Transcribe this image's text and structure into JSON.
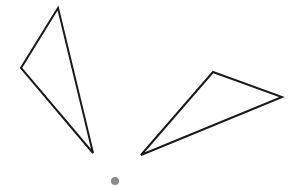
{
  "diagram": {
    "width": 303,
    "height": 188,
    "background": "#ffffff",
    "stroke_color": "#1a1a1a",
    "stroke_width": 2,
    "shapes": [
      {
        "id": "triangle-left",
        "type": "triangle",
        "points": [
          [
            58,
            8
          ],
          [
            21,
            68
          ],
          [
            93,
            153
          ]
        ]
      },
      {
        "id": "triangle-right",
        "type": "triangle",
        "points": [
          [
            213,
            72
          ],
          [
            282,
            97
          ],
          [
            141,
            155
          ]
        ]
      }
    ],
    "point": {
      "id": "center-dot",
      "cx": 115,
      "cy": 181,
      "r": 4,
      "color": "#8a8a8a"
    }
  }
}
